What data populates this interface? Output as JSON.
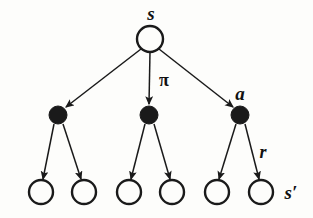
{
  "figure": {
    "kind": "backup-diagram",
    "background_color": "#fdfdfb",
    "ink_color": "#1a1a1a",
    "width": 313,
    "height": 218
  },
  "labels": {
    "root_state": "s",
    "policy": "π",
    "action": "a",
    "reward": "r",
    "next_state": "s′"
  },
  "label_positions": {
    "root_state": {
      "x": 151,
      "y": 13
    },
    "policy": {
      "x": 164,
      "y": 80
    },
    "action": {
      "x": 240,
      "y": 93
    },
    "reward": {
      "x": 263,
      "y": 152
    },
    "next_state": {
      "x": 291,
      "y": 192
    }
  },
  "nodes": {
    "root": {
      "id": "s",
      "type": "state",
      "x": 150,
      "y": 39,
      "r": 13,
      "fill": "#fdfdfb"
    },
    "actions": [
      {
        "id": "a1",
        "type": "action",
        "x": 58,
        "y": 115,
        "r": 9,
        "fill": "#1a1a1a"
      },
      {
        "id": "a2",
        "type": "action",
        "x": 149,
        "y": 115,
        "r": 9,
        "fill": "#1a1a1a"
      },
      {
        "id": "a3",
        "type": "action",
        "x": 240,
        "y": 115,
        "r": 9,
        "fill": "#1a1a1a"
      }
    ],
    "leaves": [
      {
        "id": "s1",
        "type": "state",
        "x": 41,
        "y": 192,
        "r": 12,
        "fill": "#fdfdfb"
      },
      {
        "id": "s2",
        "type": "state",
        "x": 84,
        "y": 192,
        "r": 12,
        "fill": "#fdfdfb"
      },
      {
        "id": "s3",
        "type": "state",
        "x": 129,
        "y": 192,
        "r": 12,
        "fill": "#fdfdfb"
      },
      {
        "id": "s4",
        "type": "state",
        "x": 172,
        "y": 192,
        "r": 12,
        "fill": "#fdfdfb"
      },
      {
        "id": "s5",
        "type": "state",
        "x": 217,
        "y": 192,
        "r": 12,
        "fill": "#fdfdfb"
      },
      {
        "id": "s6",
        "type": "state",
        "x": 261,
        "y": 192,
        "r": 12,
        "fill": "#fdfdfb"
      }
    ]
  },
  "edges": [
    {
      "from": "root",
      "to": "a1",
      "x1": 141,
      "y1": 49,
      "x2": 65,
      "y2": 108
    },
    {
      "from": "root",
      "to": "a2",
      "x1": 150,
      "y1": 52,
      "x2": 149,
      "y2": 105
    },
    {
      "from": "root",
      "to": "a3",
      "x1": 159,
      "y1": 49,
      "x2": 234,
      "y2": 108
    },
    {
      "from": "a1",
      "to": "s1",
      "x1": 54,
      "y1": 124,
      "x2": 43,
      "y2": 180
    },
    {
      "from": "a1",
      "to": "s2",
      "x1": 63,
      "y1": 124,
      "x2": 81,
      "y2": 180
    },
    {
      "from": "a2",
      "to": "s3",
      "x1": 145,
      "y1": 124,
      "x2": 131,
      "y2": 180
    },
    {
      "from": "a2",
      "to": "s4",
      "x1": 154,
      "y1": 124,
      "x2": 170,
      "y2": 180
    },
    {
      "from": "a3",
      "to": "s5",
      "x1": 236,
      "y1": 124,
      "x2": 219,
      "y2": 180
    },
    {
      "from": "a3",
      "to": "s6",
      "x1": 245,
      "y1": 124,
      "x2": 259,
      "y2": 180
    }
  ]
}
